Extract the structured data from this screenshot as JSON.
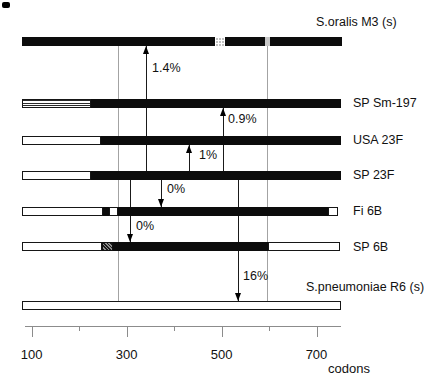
{
  "figure": {
    "rows": [
      {
        "name": "s-oralis-m3",
        "label": "S.oralis M3 (s)",
        "label_pos": {
          "x": 316,
          "y": 15
        },
        "bar": {
          "y": 37,
          "h": 9
        },
        "segments": [
          {
            "fill": "black",
            "x": 22,
            "w": 193
          },
          {
            "fill": "checker",
            "x": 215,
            "w": 10
          },
          {
            "fill": "black",
            "x": 225,
            "w": 40
          },
          {
            "fill": "lightgray",
            "x": 265,
            "w": 5
          },
          {
            "fill": "black",
            "x": 270,
            "w": 72
          }
        ]
      },
      {
        "name": "sp-sm-197",
        "label": "SP Sm-197",
        "label_pos": {
          "x": 353,
          "y": 96
        },
        "bar": {
          "y": 99,
          "h": 9
        },
        "segments": [
          {
            "fill": "hstripe",
            "x": 22,
            "w": 69
          },
          {
            "fill": "black",
            "x": 91,
            "w": 250
          }
        ]
      },
      {
        "name": "usa-23f",
        "label": "USA 23F",
        "label_pos": {
          "x": 353,
          "y": 133
        },
        "bar": {
          "y": 136,
          "h": 9
        },
        "segments": [
          {
            "fill": "white",
            "x": 22,
            "w": 79
          },
          {
            "fill": "black",
            "x": 101,
            "w": 240
          }
        ]
      },
      {
        "name": "sp-23f",
        "label": "SP 23F",
        "label_pos": {
          "x": 353,
          "y": 168
        },
        "bar": {
          "y": 171,
          "h": 9
        },
        "segments": [
          {
            "fill": "white",
            "x": 22,
            "w": 69
          },
          {
            "fill": "black",
            "x": 91,
            "w": 250
          }
        ]
      },
      {
        "name": "fi-6b",
        "label": "Fi 6B",
        "label_pos": {
          "x": 353,
          "y": 204
        },
        "bar": {
          "y": 207,
          "h": 9
        },
        "segments": [
          {
            "fill": "white",
            "x": 22,
            "w": 81
          },
          {
            "fill": "black",
            "x": 103,
            "w": 5.5
          },
          {
            "fill": "white",
            "x": 108.5,
            "w": 9.5
          },
          {
            "fill": "black",
            "x": 118,
            "w": 210
          },
          {
            "fill": "white",
            "x": 328,
            "w": 10
          }
        ]
      },
      {
        "name": "sp-6b",
        "label": "SP 6B",
        "label_pos": {
          "x": 353,
          "y": 240
        },
        "bar": {
          "y": 242,
          "h": 9
        },
        "segments": [
          {
            "fill": "white",
            "x": 22,
            "w": 80
          },
          {
            "fill": "darkhatch",
            "x": 102,
            "w": 11
          },
          {
            "fill": "black",
            "x": 113,
            "w": 155
          },
          {
            "fill": "white",
            "x": 268,
            "w": 72
          }
        ]
      },
      {
        "name": "s-pneumoniae-r6",
        "label": "S.pneumoniae R6 (s)",
        "label_pos": {
          "x": 306,
          "y": 280
        },
        "bar": {
          "y": 301,
          "h": 9
        },
        "segments": [
          {
            "fill": "white",
            "x": 22,
            "w": 319
          }
        ]
      }
    ],
    "divergence_arrows": [
      {
        "label": "1.4%",
        "x": 145.7,
        "y_top": 46,
        "y_bottom": 171,
        "direction": "up",
        "label_x": 152,
        "label_y": 61
      },
      {
        "label": "0.9%",
        "x": 222.7,
        "y_top": 108,
        "y_bottom": 171,
        "direction": "up",
        "label_x": 228,
        "label_y": 112
      },
      {
        "label": "1%",
        "x": 189.3,
        "y_top": 145,
        "y_bottom": 171,
        "direction": "up",
        "label_x": 199,
        "label_y": 148
      },
      {
        "label": "0%",
        "x": 161,
        "y_top": 180,
        "y_bottom": 207,
        "direction": "down",
        "label_x": 167,
        "label_y": 182
      },
      {
        "label": "0%",
        "x": 130,
        "y_top": 180,
        "y_bottom": 242,
        "direction": "down",
        "label_x": 136,
        "label_y": 219
      },
      {
        "label": "16%",
        "x": 238.3,
        "y_top": 180,
        "y_bottom": 301,
        "direction": "down",
        "label_x": 243,
        "label_y": 269
      }
    ],
    "block_boundary_lines": [
      {
        "x": 118.3,
        "y_top": 46,
        "y_bottom": 301
      },
      {
        "x": 267,
        "y_top": 45,
        "y_bottom": 301
      }
    ],
    "axis": {
      "y": 326,
      "x_start": 25,
      "x_end": 341,
      "major_ticks": [
        {
          "label": "100",
          "x": 31.7
        },
        {
          "label": "300",
          "x": 126.7
        },
        {
          "label": "500",
          "x": 221.7
        },
        {
          "label": "700",
          "x": 316.5
        }
      ],
      "minor_ticks": [
        {
          "x": 79
        },
        {
          "x": 174
        },
        {
          "x": 269
        }
      ],
      "unit_label": "codons"
    }
  }
}
